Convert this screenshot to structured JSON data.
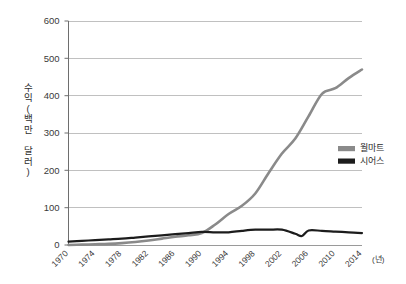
{
  "chart_data": {
    "type": "line",
    "title": "",
    "xlabel": "(년)",
    "ylabel": "수익(백만 달러)",
    "ylim": [
      0,
      600
    ],
    "xlim": [
      1970,
      2014
    ],
    "grid": true,
    "legend_position": "right-middle",
    "yticks": [
      0,
      100,
      200,
      300,
      400,
      500,
      600
    ],
    "ytick_labels": [
      "0",
      "100",
      "200",
      "300",
      "400",
      "500",
      "600"
    ],
    "xticks": [
      1970,
      1974,
      1978,
      1982,
      1986,
      1990,
      1994,
      1998,
      2002,
      2006,
      2010,
      2014
    ],
    "xtick_labels": [
      "1970",
      "1974",
      "1978",
      "1982",
      "1986",
      "1990",
      "1994",
      "1998",
      "2002",
      "2006",
      "2010",
      "2014"
    ],
    "series": [
      {
        "name": "월마트",
        "color": "#8a8a8a",
        "x": [
          1970,
          1972,
          1974,
          1976,
          1978,
          1980,
          1982,
          1984,
          1986,
          1988,
          1990,
          1992,
          1994,
          1996,
          1998,
          2000,
          2002,
          2004,
          2006,
          2008,
          2010,
          2012,
          2014
        ],
        "values": [
          0,
          1,
          2,
          3,
          5,
          8,
          12,
          17,
          22,
          26,
          32,
          55,
          83,
          105,
          138,
          193,
          245,
          285,
          345,
          405,
          420,
          447,
          470
        ]
      },
      {
        "name": "시어스",
        "color": "#1c1c1c",
        "x": [
          1970,
          1972,
          1974,
          1976,
          1978,
          1980,
          1982,
          1984,
          1986,
          1988,
          1990,
          1992,
          1994,
          1996,
          1998,
          2000,
          2002,
          2004,
          2005,
          2006,
          2008,
          2010,
          2012,
          2014
        ],
        "values": [
          9,
          11,
          13,
          15,
          17,
          20,
          23,
          26,
          29,
          32,
          35,
          34,
          34,
          38,
          41,
          41,
          41,
          30,
          24,
          39,
          38,
          36,
          34,
          32
        ]
      }
    ]
  },
  "legend": {
    "items": [
      {
        "label": "월마트",
        "color": "#8a8a8a"
      },
      {
        "label": "시어스",
        "color": "#1c1c1c"
      }
    ]
  },
  "axes": {
    "y_axis_label": "수익(백만 달러)",
    "x_unit_label": "(년)"
  },
  "style": {
    "grid_color": "#b9b9b9",
    "axis_color": "#6e6e6e",
    "background": "#ffffff"
  }
}
